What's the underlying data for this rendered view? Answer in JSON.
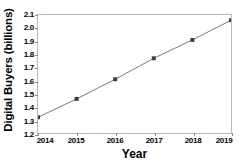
{
  "chart_data": {
    "type": "line",
    "title": "",
    "xlabel": "Year",
    "ylabel": "Digital Buyers (billions)",
    "categories": [
      "2014",
      "2015",
      "2016",
      "2017",
      "2018",
      "2019"
    ],
    "x": [
      2014,
      2015,
      2016,
      2017,
      2018,
      2019
    ],
    "values": [
      1.32,
      1.46,
      1.61,
      1.77,
      1.91,
      2.06
    ],
    "series": [
      {
        "name": "Digital Buyers",
        "values": [
          1.32,
          1.46,
          1.61,
          1.77,
          1.91,
          2.06
        ]
      }
    ],
    "xlim": [
      2014,
      2019
    ],
    "ylim": [
      1.2,
      2.1
    ],
    "ytick_labels": [
      "2.1",
      "2.0",
      "1.9",
      "1.8",
      "1.7",
      "1.6",
      "1.5",
      "1.4",
      "1.3",
      "1.2"
    ],
    "ytick_values": [
      2.1,
      2.0,
      1.9,
      1.8,
      1.7,
      1.6,
      1.5,
      1.4,
      1.3,
      1.2
    ],
    "xtick_labels": [
      "2014",
      "2015",
      "2016",
      "2017",
      "2018",
      "2019"
    ],
    "grid": false,
    "legend": false,
    "legend_position": "none",
    "marker": "square",
    "colors": {
      "line": "#7a7a7a",
      "marker": "#3b3b3b",
      "axis": "#b9b9b9",
      "text": "#000000",
      "background": "#ffffff"
    }
  }
}
